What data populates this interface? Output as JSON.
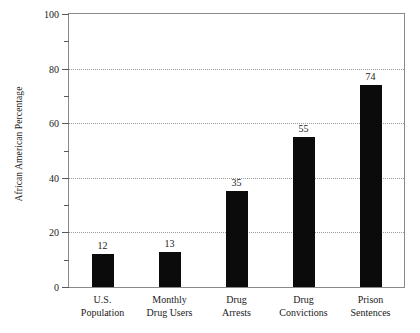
{
  "chart_data": {
    "type": "bar",
    "title": "",
    "xlabel": "",
    "ylabel": "African American Percentage",
    "categories": [
      "U.S.\nPopulation",
      "Monthly\nDrug Users",
      "Drug\nArrests",
      "Drug\nConvictions",
      "Prison\nSentences"
    ],
    "category_lines": [
      [
        "U.S.",
        "Population"
      ],
      [
        "Monthly",
        "Drug Users"
      ],
      [
        "Drug",
        "Arrests"
      ],
      [
        "Drug",
        "Convictions"
      ],
      [
        "Prison",
        "Sentences"
      ]
    ],
    "values": [
      12,
      13,
      35,
      55,
      74
    ],
    "value_labels": [
      "12",
      "13",
      "35",
      "55",
      "74"
    ],
    "ylim": [
      0,
      100
    ],
    "ytick_labels": [
      "0",
      "20",
      "40",
      "60",
      "80",
      "100"
    ],
    "ytick_values": [
      0,
      20,
      40,
      60,
      80,
      100
    ],
    "yminor_ticks": [
      10,
      30,
      50,
      70,
      90
    ],
    "gridlines": [
      20,
      40,
      60,
      80
    ],
    "grid": true,
    "legend": "none",
    "bar_color": "#0b0b0b",
    "grid_color": "#9b9b9b",
    "frame_color": "#8a8a8a",
    "background": "#ffffff"
  }
}
